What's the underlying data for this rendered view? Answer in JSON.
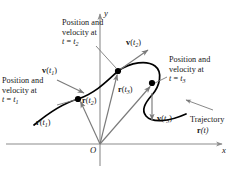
{
  "figure": {
    "kind": "physics-trajectory-diagram",
    "colors": {
      "curve": "#000000",
      "vector": "#7a7a7a",
      "axis": "#8c8c8c",
      "point": "#000000",
      "text": "#141414",
      "background": "#ffffff"
    }
  },
  "axes": {
    "x_label": "x",
    "y_label": "y",
    "origin_label": "O"
  },
  "callouts": {
    "t1": {
      "line1": "Position and",
      "line2": "velocity at",
      "line3_t": "t",
      "line3_eq": " = ",
      "line3_sym": "t",
      "line3_sub": "1"
    },
    "t2": {
      "line1": "Position and",
      "line2": "velocity at",
      "line3_t": "t",
      "line3_eq": " = ",
      "line3_sym": "t",
      "line3_sub": "2"
    },
    "t3": {
      "line1": "Position and",
      "line2": "velocity at",
      "line3_t": "t",
      "line3_eq": " = ",
      "line3_sym": "t",
      "line3_sub": "3"
    }
  },
  "trajectory": {
    "label": "Trajectory",
    "function_bold": "r",
    "function_arg": "(t)"
  },
  "position_vectors": [
    {
      "name": "r-t1",
      "bold": "r",
      "open": "(",
      "sym": "t",
      "sub": "1",
      "close": ")"
    },
    {
      "name": "r-t2",
      "bold": "r",
      "open": "(",
      "sym": "t",
      "sub": "2",
      "close": ")"
    },
    {
      "name": "r-t3",
      "bold": "r",
      "open": "(",
      "sym": "t",
      "sub": "3",
      "close": ")"
    }
  ],
  "velocity_vectors": [
    {
      "name": "v-t1",
      "bold": "v",
      "open": "(",
      "sym": "t",
      "sub": "1",
      "close": ")"
    },
    {
      "name": "v-t2",
      "bold": "v",
      "open": "(",
      "sym": "t",
      "sub": "2",
      "close": ")"
    },
    {
      "name": "v-t3",
      "bold": "v",
      "open": "(",
      "sym": "t",
      "sub": "3",
      "close": ")"
    }
  ],
  "points": [
    {
      "name": "point-t1",
      "x": 78,
      "y": 99
    },
    {
      "name": "point-t2",
      "x": 118,
      "y": 71
    },
    {
      "name": "point-t3",
      "x": 152,
      "y": 83
    }
  ]
}
